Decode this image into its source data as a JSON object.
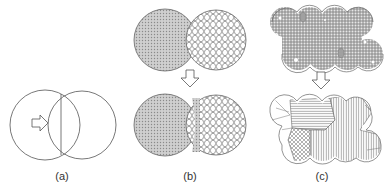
{
  "figure": {
    "panels": [
      {
        "id": "a",
        "label": "(a)",
        "description": "Two overlapping circles with right arrow (initial contact)"
      },
      {
        "id": "b",
        "label": "(b)",
        "description": "Dense grain (left) and hexagonal cellular grain (right): before and after neck growth"
      },
      {
        "id": "c",
        "label": "(c)",
        "description": "Cluster of particles with fine structure and pores transforming into coarse grains"
      }
    ],
    "colors": {
      "stroke": "#555555",
      "fill_gray": "#c8c8c8",
      "dot_pattern": "#888888",
      "pore": "#9a9a9a"
    }
  }
}
